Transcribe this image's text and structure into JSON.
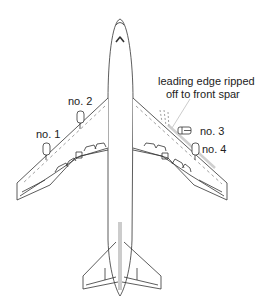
{
  "diagram": {
    "colors": {
      "line": "#333333",
      "dashed": "#888888",
      "annotation_line": "#cccccc",
      "background": "#ffffff"
    },
    "engines": [
      {
        "id": "no1",
        "label": "no. 1"
      },
      {
        "id": "no2",
        "label": "no. 2"
      },
      {
        "id": "no3",
        "label": "no. 3"
      },
      {
        "id": "no4",
        "label": "no. 4"
      }
    ],
    "annotation": {
      "line1": "leading edge ripped",
      "line2": "off to front spar"
    }
  }
}
